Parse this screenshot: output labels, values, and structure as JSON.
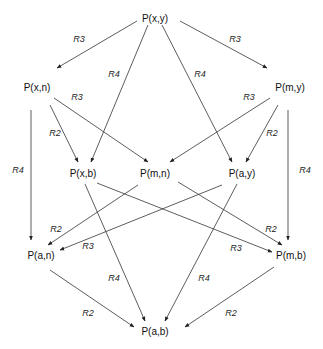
{
  "nodes": [
    {
      "id": "xy",
      "label": "P(x,y)",
      "x": 155,
      "y": 18
    },
    {
      "id": "xn",
      "label": "P(x,n)",
      "x": 37,
      "y": 87
    },
    {
      "id": "my",
      "label": "P(m,y)",
      "x": 290,
      "y": 87
    },
    {
      "id": "xb",
      "label": "P(x,b)",
      "x": 83,
      "y": 173
    },
    {
      "id": "mn",
      "label": "P(m,n)",
      "x": 155,
      "y": 173
    },
    {
      "id": "ay",
      "label": "P(a,y)",
      "x": 242,
      "y": 173
    },
    {
      "id": "an",
      "label": "P(a,n)",
      "x": 41,
      "y": 255
    },
    {
      "id": "mb",
      "label": "P(m,b)",
      "x": 291,
      "y": 255
    },
    {
      "id": "ab",
      "label": "P(a,b)",
      "x": 155,
      "y": 331
    }
  ],
  "edges": [
    {
      "from": "xy",
      "to": "xn",
      "label": "R3",
      "x1": 137,
      "y1": 21,
      "x2": 57,
      "y2": 68,
      "lx": 79,
      "ly": 39
    },
    {
      "from": "xy",
      "to": "my",
      "label": "R3",
      "x1": 180,
      "y1": 21,
      "x2": 267,
      "y2": 68,
      "lx": 235,
      "ly": 39
    },
    {
      "from": "xy",
      "to": "xb",
      "label": "R4",
      "x1": 148,
      "y1": 25,
      "x2": 91,
      "y2": 162,
      "lx": 114,
      "ly": 74
    },
    {
      "from": "xy",
      "to": "ay",
      "label": "R4",
      "x1": 162,
      "y1": 25,
      "x2": 232,
      "y2": 162,
      "lx": 200,
      "ly": 74
    },
    {
      "from": "xn",
      "to": "xb",
      "label": "R2",
      "x1": 50,
      "y1": 105,
      "x2": 78,
      "y2": 162,
      "lx": 55,
      "ly": 133
    },
    {
      "from": "xn",
      "to": "mn",
      "label": "R3",
      "x1": 54,
      "y1": 98,
      "x2": 148,
      "y2": 162,
      "lx": 77,
      "ly": 97
    },
    {
      "from": "xn",
      "to": "an",
      "label": "R4",
      "x1": 31,
      "y1": 110,
      "x2": 31,
      "y2": 240,
      "lx": 18,
      "ly": 170
    },
    {
      "from": "my",
      "to": "mn",
      "label": "R3",
      "x1": 270,
      "y1": 98,
      "x2": 170,
      "y2": 162,
      "lx": 249,
      "ly": 97
    },
    {
      "from": "my",
      "to": "ay",
      "label": "R2",
      "x1": 278,
      "y1": 105,
      "x2": 246,
      "y2": 162,
      "lx": 272,
      "ly": 133
    },
    {
      "from": "my",
      "to": "mb",
      "label": "R4",
      "x1": 288,
      "y1": 110,
      "x2": 288,
      "y2": 240,
      "lx": 305,
      "ly": 170
    },
    {
      "from": "mn",
      "to": "an",
      "label": "R2",
      "x1": 138,
      "y1": 185,
      "x2": 48,
      "y2": 245,
      "lx": 56,
      "ly": 229
    },
    {
      "from": "ay",
      "to": "an",
      "label": "R3",
      "x1": 222,
      "y1": 185,
      "x2": 60,
      "y2": 250,
      "lx": 88,
      "ly": 246
    },
    {
      "from": "xb",
      "to": "mb",
      "label": "R3",
      "x1": 97,
      "y1": 183,
      "x2": 272,
      "y2": 252,
      "lx": 236,
      "ly": 248
    },
    {
      "from": "mn",
      "to": "mb",
      "label": "R2",
      "x1": 178,
      "y1": 182,
      "x2": 282,
      "y2": 245,
      "lx": 271,
      "ly": 229
    },
    {
      "from": "xb",
      "to": "ab",
      "label": "R4",
      "x1": 85,
      "y1": 184,
      "x2": 145,
      "y2": 321,
      "lx": 114,
      "ly": 278
    },
    {
      "from": "ay",
      "to": "ab",
      "label": "R4",
      "x1": 237,
      "y1": 184,
      "x2": 165,
      "y2": 321,
      "lx": 204,
      "ly": 278
    },
    {
      "from": "an",
      "to": "ab",
      "label": "R2",
      "x1": 50,
      "y1": 270,
      "x2": 134,
      "y2": 327,
      "lx": 88,
      "ly": 313
    },
    {
      "from": "mb",
      "to": "ab",
      "label": "R2",
      "x1": 274,
      "y1": 267,
      "x2": 185,
      "y2": 327,
      "lx": 231,
      "ly": 313
    }
  ]
}
